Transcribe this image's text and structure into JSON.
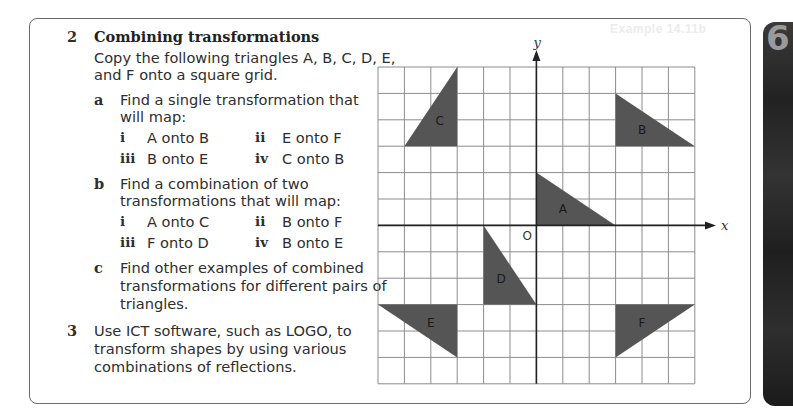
{
  "ghost_text": "Example 14.11b",
  "chapter_tab": "6",
  "q2": {
    "number": "2",
    "title": "Combining transformations",
    "intro": [
      "Copy the following triangles A, B, C, D, E,",
      "and F onto a square grid."
    ],
    "a": {
      "letter": "a",
      "text": [
        "Find a single transformation that",
        "will map:"
      ],
      "items": [
        {
          "num": "i",
          "text": "A onto B"
        },
        {
          "num": "ii",
          "text": "E onto F"
        },
        {
          "num": "iii",
          "text": "B onto E"
        },
        {
          "num": "iv",
          "text": "C onto B"
        }
      ]
    },
    "b": {
      "letter": "b",
      "text": [
        "Find a combination of two",
        "transformations that will map:"
      ],
      "items": [
        {
          "num": "i",
          "text": "A onto C"
        },
        {
          "num": "ii",
          "text": "B onto F"
        },
        {
          "num": "iii",
          "text": "F onto D"
        },
        {
          "num": "iv",
          "text": "B onto E"
        }
      ]
    },
    "c": {
      "letter": "c",
      "text": [
        "Find other examples of combined",
        "transformations for different pairs of",
        "triangles."
      ]
    }
  },
  "q3": {
    "number": "3",
    "text": [
      "Use ICT software, such as LOGO, to",
      "transform shapes by using various",
      "combinations of reflections."
    ]
  },
  "figure": {
    "x_label": "x",
    "y_label": "y",
    "origin_label": "O",
    "grid_range": {
      "x": [
        -6,
        6
      ],
      "y": [
        -6,
        6
      ]
    },
    "fill_color": "#555555",
    "triangles": [
      {
        "label": "A",
        "points": [
          [
            0,
            0
          ],
          [
            3,
            0
          ],
          [
            0,
            2
          ]
        ]
      },
      {
        "label": "B",
        "points": [
          [
            3,
            5
          ],
          [
            3,
            3
          ],
          [
            6,
            3
          ]
        ]
      },
      {
        "label": "C",
        "points": [
          [
            -3,
            6
          ],
          [
            -3,
            3
          ],
          [
            -5,
            3
          ]
        ]
      },
      {
        "label": "D",
        "points": [
          [
            -2,
            0
          ],
          [
            -2,
            -3
          ],
          [
            0,
            -3
          ]
        ]
      },
      {
        "label": "E",
        "points": [
          [
            -6,
            -3
          ],
          [
            -3,
            -3
          ],
          [
            -3,
            -5
          ]
        ]
      },
      {
        "label": "F",
        "points": [
          [
            3,
            -3
          ],
          [
            6,
            -3
          ],
          [
            3,
            -5
          ]
        ]
      }
    ]
  }
}
